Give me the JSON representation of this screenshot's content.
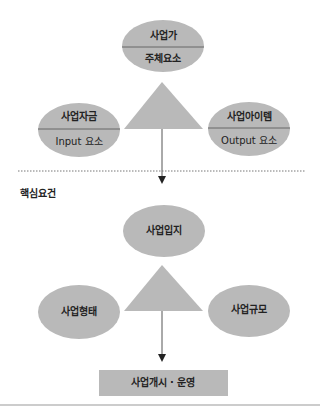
{
  "top_section": {
    "subject": {
      "title": "사업가",
      "subtitle": "주체요소"
    },
    "input": {
      "title": "사업자금",
      "subtitle": "Input 요소"
    },
    "output": {
      "title": "사업아이템",
      "subtitle": "Output 요소"
    }
  },
  "section_label": "핵심요건",
  "bottom_section": {
    "location": "사업입지",
    "form": "사업형태",
    "scale": "사업규모"
  },
  "result_box": "사업개시 · 운영",
  "colors": {
    "shape_fill": "#b9b9b9",
    "line": "#555555",
    "divider": "#666666"
  }
}
